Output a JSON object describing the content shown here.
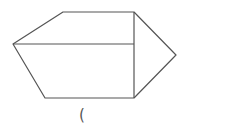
{
  "diagram": {
    "type": "geometric-figure",
    "stroke_color": "#555555",
    "vertices": {
      "top_left": [
        63,
        12
      ],
      "top_right": [
        134,
        12
      ],
      "left": [
        13,
        44
      ],
      "mid_right": [
        134,
        44
      ],
      "right_tip": [
        176,
        55
      ],
      "bottom_right": [
        134,
        98
      ],
      "bottom_left": [
        45,
        98
      ]
    }
  },
  "caption": {
    "text": "("
  }
}
